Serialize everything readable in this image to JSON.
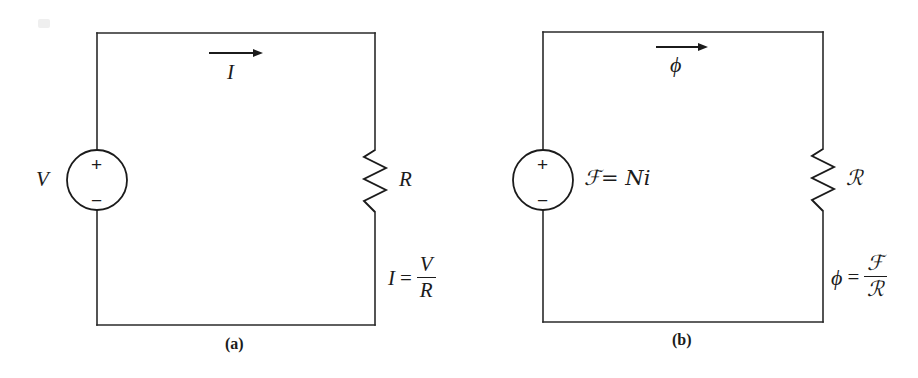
{
  "figure": {
    "type": "electric-and-magnetic-circuit-analogy",
    "panels": [
      {
        "id": "a",
        "caption": "(a)",
        "source_label": "V",
        "source_plus": "+",
        "source_minus": "−",
        "flow_label": "I",
        "resistor_label": "R",
        "equation": {
          "lhs": "I",
          "operator": "=",
          "numerator": "V",
          "denominator": "R"
        }
      },
      {
        "id": "b",
        "caption": "(b)",
        "source_label": "ℱ= Ni",
        "source_plus": "+",
        "source_minus": "−",
        "flow_label": "ϕ",
        "resistor_label": "ℛ",
        "equation": {
          "lhs": "ϕ",
          "operator": "=",
          "numerator": "ℱ",
          "denominator": "ℛ"
        }
      }
    ],
    "colors": {
      "background": "#ffffff",
      "ink": "#1b1b1b",
      "wire": "#2a2a2a"
    }
  }
}
